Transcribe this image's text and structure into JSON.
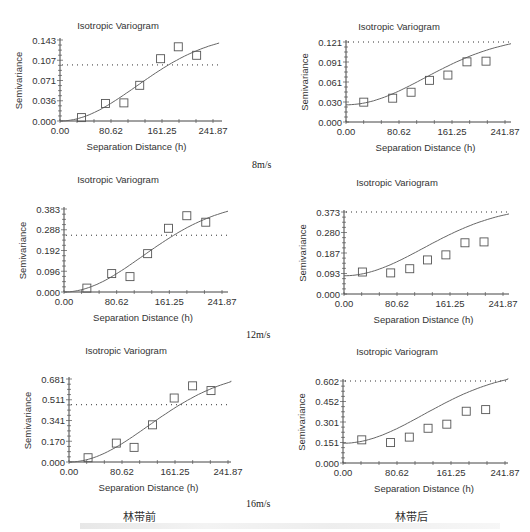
{
  "labels": {
    "speed_8": "8m/s",
    "speed_12": "12m/s",
    "speed_16": "16m/s",
    "before": "林带前",
    "after": "林带后"
  },
  "chart_data": [
    {
      "type": "scatter",
      "title": "Isotropic Variogram",
      "xlabel": "Separation Distance (h)",
      "ylabel": "Semivariance",
      "xticks": [
        "0.00",
        "80.62",
        "161.25",
        "241.87"
      ],
      "yticks": [
        "0.000",
        "0.036",
        "0.071",
        "0.107",
        "0.143"
      ],
      "xlim": [
        0,
        241.87
      ],
      "ylim": [
        0,
        0.143
      ],
      "sill_line": 0.099,
      "points": {
        "x": [
          34,
          72,
          101,
          126,
          159,
          187,
          216
        ],
        "y": [
          0.006,
          0.031,
          0.032,
          0.063,
          0.11,
          0.131,
          0.116
        ]
      },
      "model": "gaussian",
      "nugget": 0.0,
      "range_hint": 250,
      "sill": 0.155,
      "group": "林带前",
      "speed": "8m/s"
    },
    {
      "type": "scatter",
      "title": "Isotropic Variogram",
      "xlabel": "Separation Distance (h)",
      "ylabel": "Semivariance",
      "xticks": [
        "0.00",
        "80.62",
        "161.25",
        "241.87"
      ],
      "yticks": [
        "0.000",
        "0.030",
        "0.061",
        "0.091",
        "0.121"
      ],
      "xlim": [
        0,
        241.87
      ],
      "ylim": [
        0,
        0.121
      ],
      "sill_line": 0.121,
      "points": {
        "x": [
          27,
          71,
          99,
          127,
          155,
          184,
          213
        ],
        "y": [
          0.03,
          0.036,
          0.045,
          0.063,
          0.071,
          0.091,
          0.092
        ]
      },
      "model": "gaussian",
      "nugget": 0.026,
      "sill": 0.13,
      "group": "林带后",
      "speed": "8m/s"
    },
    {
      "type": "scatter",
      "title": "Isotropic Variogram",
      "xlabel": "Separation Distance (h)",
      "ylabel": "Semivariance",
      "xticks": [
        "0.00",
        "80.62",
        "161.25",
        "241.87"
      ],
      "yticks": [
        "0.000",
        "0.096",
        "0.192",
        "0.288",
        "0.383"
      ],
      "xlim": [
        0,
        241.87
      ],
      "ylim": [
        0,
        0.383
      ],
      "sill_line": 0.262,
      "points": {
        "x": [
          35,
          73,
          101,
          128,
          160,
          188,
          217
        ],
        "y": [
          0.018,
          0.085,
          0.071,
          0.177,
          0.294,
          0.352,
          0.322
        ]
      },
      "model": "gaussian",
      "nugget": 0.0,
      "sill": 0.42,
      "group": "林带前",
      "speed": "12m/s"
    },
    {
      "type": "scatter",
      "title": "Isotropic Variogram",
      "xlabel": "Separation Distance (h)",
      "ylabel": "Semivariance",
      "xticks": [
        "0.00",
        "80.62",
        "161.25",
        "241.87"
      ],
      "yticks": [
        "0.000",
        "0.093",
        "0.187",
        "0.280",
        "0.373"
      ],
      "xlim": [
        0,
        241.87
      ],
      "ylim": [
        0,
        0.373
      ],
      "sill_line": 0.373,
      "points": {
        "x": [
          28,
          71,
          100,
          127,
          155,
          184,
          213
        ],
        "y": [
          0.1,
          0.096,
          0.115,
          0.155,
          0.178,
          0.233,
          0.237
        ]
      },
      "model": "gaussian",
      "nugget": 0.083,
      "sill": 0.4,
      "group": "林带后",
      "speed": "12m/s"
    },
    {
      "type": "scatter",
      "title": "Isotropic Variogram",
      "xlabel": "Separation Distance (h)",
      "ylabel": "Semivariance",
      "xticks": [
        "0.00",
        "80.62",
        "161.25",
        "241.87"
      ],
      "yticks": [
        "0.000",
        "0.170",
        "0.341",
        "0.511",
        "0.681"
      ],
      "xlim": [
        0,
        241.87
      ],
      "ylim": [
        0,
        0.681
      ],
      "sill_line": 0.47,
      "points": {
        "x": [
          29,
          72,
          99,
          127,
          160,
          188,
          216
        ],
        "y": [
          0.035,
          0.155,
          0.12,
          0.305,
          0.525,
          0.625,
          0.586
        ]
      },
      "model": "gaussian",
      "nugget": 0.0,
      "sill": 0.75,
      "group": "林带前",
      "speed": "16m/s"
    },
    {
      "type": "scatter",
      "title": "Isotropic Variogram",
      "xlabel": "Separation Distance (h)",
      "ylabel": "Semivariance",
      "xticks": [
        "0.00",
        "80.62",
        "161.25",
        "241.87"
      ],
      "yticks": [
        "0.000",
        "0.151",
        "0.301",
        "0.452",
        "0.602"
      ],
      "xlim": [
        0,
        241.87
      ],
      "ylim": [
        0,
        0.602
      ],
      "sill_line": 0.602,
      "points": {
        "x": [
          28,
          71,
          99,
          127,
          155,
          184,
          213
        ],
        "y": [
          0.17,
          0.15,
          0.19,
          0.255,
          0.285,
          0.38,
          0.392
        ]
      },
      "model": "gaussian",
      "nugget": 0.145,
      "sill": 0.68,
      "group": "林带后",
      "speed": "16m/s"
    }
  ],
  "layout": [
    {
      "ax": 60,
      "top": 40,
      "bottom": 121,
      "right": 213,
      "lineEnd": 222,
      "titleX": 118,
      "titleY": 29
    },
    {
      "ax": 346,
      "top": 42,
      "bottom": 122,
      "right": 505,
      "lineEnd": 511,
      "titleX": 399,
      "titleY": 30
    },
    {
      "ax": 64,
      "top": 209,
      "bottom": 292,
      "right": 222,
      "lineEnd": 228,
      "titleX": 118,
      "titleY": 183
    },
    {
      "ax": 344,
      "top": 212,
      "bottom": 294,
      "right": 503,
      "lineEnd": 509,
      "titleX": 397,
      "titleY": 186
    },
    {
      "ax": 69,
      "top": 379,
      "bottom": 462,
      "right": 228,
      "lineEnd": 231,
      "titleX": 126,
      "titleY": 354
    },
    {
      "ax": 343,
      "top": 381,
      "bottom": 463,
      "right": 505,
      "lineEnd": 508,
      "titleX": 397,
      "titleY": 355
    }
  ]
}
